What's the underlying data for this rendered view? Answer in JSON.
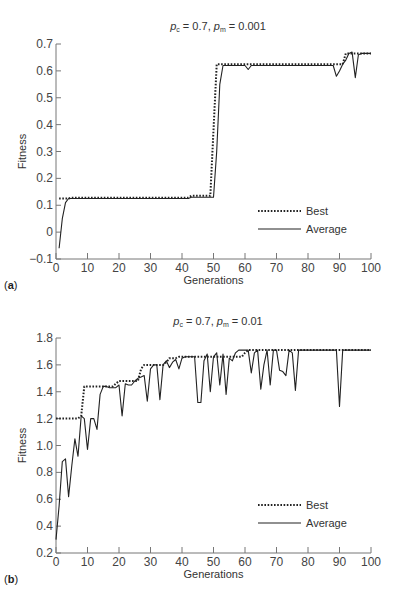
{
  "chart_data": [
    {
      "type": "line",
      "panel_label": "a",
      "title": "p_c = 0.7, p_m = 0.001",
      "title_parts": {
        "pc": "p",
        "pc_sub": "c",
        "eq1": " = 0.7, ",
        "pm": "p",
        "pm_sub": "m",
        "eq2": " = 0.001"
      },
      "xlabel": "Generations",
      "ylabel": "Fitness",
      "xlim": [
        0,
        100
      ],
      "ylim": [
        -0.1,
        0.7
      ],
      "xticks": [
        0,
        10,
        20,
        30,
        40,
        50,
        60,
        70,
        80,
        90,
        100
      ],
      "yticks": [
        -0.1,
        0,
        0.1,
        0.2,
        0.3,
        0.4,
        0.5,
        0.6,
        0.7
      ],
      "ytick_labels": [
        "−0.1",
        "0",
        "0.1",
        "0.2",
        "0.3",
        "0.4",
        "0.5",
        "0.6",
        "0.7"
      ],
      "grid": false,
      "legend": {
        "position": "lower right",
        "entries": [
          "Best",
          "Average"
        ]
      },
      "series": [
        {
          "name": "Best",
          "style": "dotted",
          "x": [
            1,
            2,
            3,
            4,
            5,
            42,
            43,
            49,
            50,
            51,
            52,
            53,
            89,
            90,
            91,
            92,
            93,
            94,
            95,
            96,
            97,
            98,
            99,
            100
          ],
          "y": [
            0.125,
            0.125,
            0.125,
            0.125,
            0.128,
            0.128,
            0.135,
            0.135,
            0.38,
            0.625,
            0.625,
            0.625,
            0.625,
            0.625,
            0.625,
            0.665,
            0.665,
            0.665,
            0.665,
            0.665,
            0.665,
            0.665,
            0.665,
            0.665
          ]
        },
        {
          "name": "Average",
          "style": "solid",
          "x": [
            1,
            2,
            3,
            4,
            5,
            42,
            43,
            50,
            51,
            52,
            53,
            60,
            61,
            62,
            88,
            89,
            90,
            91,
            92,
            93,
            94,
            95,
            96,
            97,
            98,
            99,
            100
          ],
          "y": [
            -0.06,
            0.05,
            0.11,
            0.125,
            0.125,
            0.125,
            0.13,
            0.13,
            0.3,
            0.55,
            0.62,
            0.62,
            0.605,
            0.62,
            0.62,
            0.58,
            0.6,
            0.625,
            0.64,
            0.665,
            0.67,
            0.575,
            0.66,
            0.665,
            0.665,
            0.665,
            0.665
          ]
        }
      ]
    },
    {
      "type": "line",
      "panel_label": "b",
      "title": "p_c = 0.7, p_m = 0.01",
      "title_parts": {
        "pc": "p",
        "pc_sub": "c",
        "eq1": " = 0.7, ",
        "pm": "p",
        "pm_sub": "m",
        "eq2": " = 0.01"
      },
      "xlabel": "Generations",
      "ylabel": "Fitness",
      "xlim": [
        0,
        100
      ],
      "ylim": [
        0.2,
        1.8
      ],
      "xticks": [
        0,
        10,
        20,
        30,
        40,
        50,
        60,
        70,
        80,
        90,
        100
      ],
      "yticks": [
        0.2,
        0.4,
        0.6,
        0.8,
        1.0,
        1.2,
        1.4,
        1.6,
        1.8
      ],
      "ytick_labels": [
        "0.2",
        "0.4",
        "0.6",
        "0.8",
        "1.0",
        "1.2",
        "1.4",
        "1.6",
        "1.8"
      ],
      "grid": false,
      "legend": {
        "position": "lower right",
        "entries": [
          "Best",
          "Average"
        ]
      },
      "series": [
        {
          "name": "Best",
          "style": "dotted",
          "x": [
            0,
            7,
            8,
            9,
            10,
            18,
            19,
            20,
            26,
            27,
            28,
            34,
            35,
            36,
            38,
            39,
            40,
            59,
            60,
            61,
            100
          ],
          "y": [
            1.2,
            1.2,
            1.22,
            1.44,
            1.44,
            1.44,
            1.46,
            1.48,
            1.48,
            1.57,
            1.6,
            1.6,
            1.62,
            1.65,
            1.65,
            1.66,
            1.66,
            1.66,
            1.69,
            1.71,
            1.71
          ]
        },
        {
          "name": "Average",
          "style": "solid",
          "x": [
            0,
            1,
            2,
            3,
            4,
            5,
            6,
            7,
            8,
            9,
            10,
            11,
            12,
            13,
            14,
            15,
            16,
            17,
            18,
            19,
            20,
            21,
            22,
            23,
            24,
            25,
            26,
            27,
            28,
            29,
            30,
            31,
            32,
            33,
            34,
            35,
            36,
            37,
            38,
            39,
            40,
            41,
            42,
            43,
            44,
            45,
            46,
            47,
            48,
            49,
            50,
            51,
            52,
            53,
            54,
            55,
            56,
            57,
            58,
            59,
            60,
            61,
            62,
            63,
            64,
            65,
            66,
            67,
            68,
            69,
            70,
            71,
            72,
            73,
            74,
            75,
            76,
            77,
            78,
            79,
            80,
            81,
            82,
            83,
            84,
            85,
            86,
            87,
            88,
            89,
            90,
            91,
            100
          ],
          "y": [
            0.3,
            0.55,
            0.88,
            0.9,
            0.62,
            0.85,
            1.05,
            0.92,
            1.22,
            1.2,
            0.97,
            1.2,
            1.2,
            1.12,
            1.38,
            1.44,
            1.44,
            1.43,
            1.43,
            1.43,
            1.45,
            1.22,
            1.46,
            1.45,
            1.45,
            1.48,
            1.5,
            1.51,
            1.52,
            1.33,
            1.57,
            1.6,
            1.6,
            1.34,
            1.6,
            1.63,
            1.58,
            1.62,
            1.64,
            1.57,
            1.65,
            1.66,
            1.66,
            1.66,
            1.66,
            1.32,
            1.32,
            1.63,
            1.68,
            1.4,
            1.66,
            1.69,
            1.45,
            1.68,
            1.38,
            1.65,
            1.63,
            1.69,
            1.71,
            1.71,
            1.71,
            1.71,
            1.54,
            1.69,
            1.71,
            1.42,
            1.6,
            1.71,
            1.45,
            1.71,
            1.71,
            1.56,
            1.55,
            1.52,
            1.71,
            1.69,
            1.41,
            1.71,
            1.71,
            1.71,
            1.71,
            1.71,
            1.71,
            1.71,
            1.71,
            1.71,
            1.71,
            1.71,
            1.71,
            1.71,
            1.29,
            1.71,
            1.71
          ]
        }
      ]
    }
  ]
}
